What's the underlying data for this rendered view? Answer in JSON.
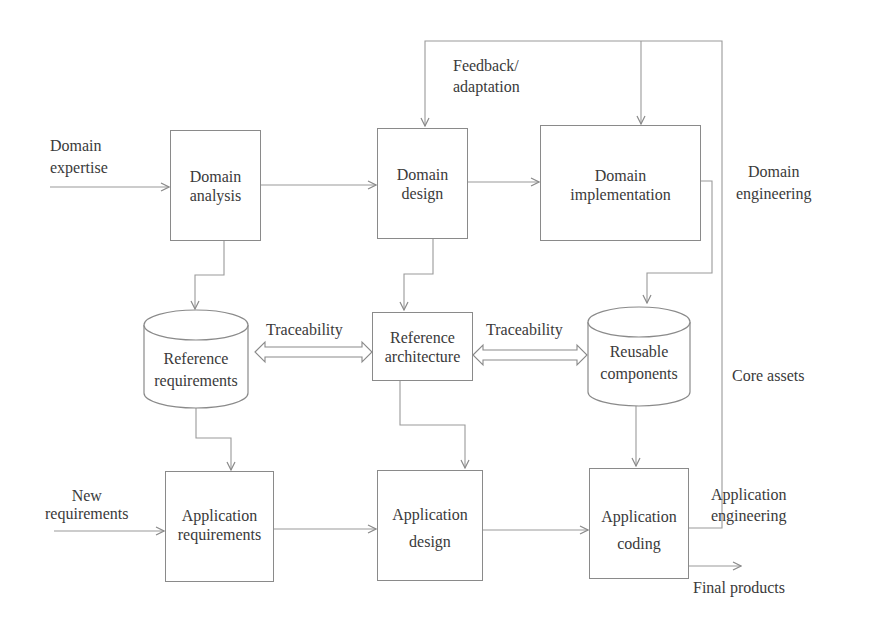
{
  "diagram": {
    "type": "flowchart",
    "nodes": {
      "domain_analysis": {
        "label": "Domain analysis",
        "line1": "Domain",
        "line2": "analysis",
        "shape": "rectangle"
      },
      "domain_design": {
        "label": "Domain design",
        "line1": "Domain",
        "line2": "design",
        "shape": "rectangle"
      },
      "domain_implementation": {
        "label": "Domain implementation",
        "line1": "Domain",
        "line2": "implementation",
        "shape": "rectangle"
      },
      "reference_requirements": {
        "label": "Reference requirements",
        "line1": "Reference",
        "line2": "requirements",
        "shape": "cylinder"
      },
      "reference_architecture": {
        "label": "Reference architecture",
        "line1": "Reference",
        "line2": "architecture",
        "shape": "rectangle"
      },
      "reusable_components": {
        "label": "Reusable components",
        "line1": "Reusable",
        "line2": "components",
        "shape": "cylinder"
      },
      "application_requirements": {
        "label": "Application requirements",
        "line1": "Application",
        "line2": "requirements",
        "shape": "rectangle"
      },
      "application_design": {
        "label": "Application design",
        "line1": "Application",
        "line2": "design",
        "shape": "rectangle"
      },
      "application_coding": {
        "label": "Application coding",
        "line1": "Application",
        "line2": "coding",
        "shape": "rectangle"
      }
    },
    "labels": {
      "domain_expertise": {
        "line1": "Domain",
        "line2": "expertise"
      },
      "feedback": {
        "line1": "Feedback/",
        "line2": "adaptation"
      },
      "domain_engineering": {
        "line1": "Domain",
        "line2": "engineering"
      },
      "traceability_left": "Traceability",
      "traceability_right": "Traceability",
      "core_assets": "Core assets",
      "new_requirements": {
        "line1": "New",
        "line2": "requirements"
      },
      "application_engineering": {
        "line1": "Application",
        "line2": "engineering"
      },
      "final_products": "Final products"
    },
    "edges": [
      {
        "from": "Domain expertise",
        "to": "domain_analysis"
      },
      {
        "from": "domain_analysis",
        "to": "domain_design"
      },
      {
        "from": "domain_design",
        "to": "domain_implementation"
      },
      {
        "from": "domain_analysis",
        "to": "reference_requirements"
      },
      {
        "from": "domain_design",
        "to": "reference_architecture"
      },
      {
        "from": "domain_implementation",
        "to": "reusable_components"
      },
      {
        "from": "reference_requirements",
        "to": "reference_architecture",
        "bidirectional": true,
        "label": "Traceability"
      },
      {
        "from": "reference_architecture",
        "to": "reusable_components",
        "bidirectional": true,
        "label": "Traceability"
      },
      {
        "from": "reference_requirements",
        "to": "application_requirements"
      },
      {
        "from": "reference_architecture",
        "to": "application_design"
      },
      {
        "from": "reusable_components",
        "to": "application_coding"
      },
      {
        "from": "New requirements",
        "to": "application_requirements"
      },
      {
        "from": "application_requirements",
        "to": "application_design"
      },
      {
        "from": "application_design",
        "to": "application_coding"
      },
      {
        "from": "application_coding",
        "to": "Final products"
      },
      {
        "from": "application_coding",
        "to": "domain_design",
        "label": "Feedback/adaptation"
      },
      {
        "from": "application_coding",
        "to": "domain_implementation",
        "label": "Feedback/adaptation"
      }
    ],
    "colors": {
      "line": "#8a8a8a",
      "text": "#3a3a3a",
      "background": "#ffffff"
    }
  }
}
